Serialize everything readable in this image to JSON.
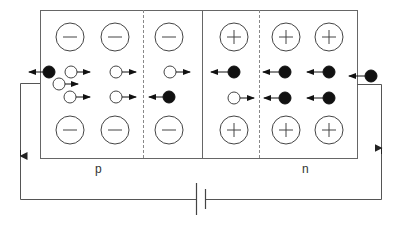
{
  "diagram": {
    "regions": [
      {
        "id": "p",
        "label": "p"
      },
      {
        "id": "n",
        "label": "n"
      }
    ],
    "colors": {
      "line": "#555555",
      "ion_stroke": "#444444",
      "electron_fill": "#111111",
      "hole_fill": "#ffffff",
      "background": "#ffffff"
    },
    "ions": {
      "negative_symbol": "−",
      "positive_symbol": "+",
      "p_side_top": [
        "−",
        "−",
        "−"
      ],
      "p_side_bottom": [
        "−",
        "−",
        "−"
      ],
      "n_side_top": [
        "+",
        "+",
        "+"
      ],
      "n_side_bottom": [
        "+",
        "+",
        "+"
      ]
    },
    "carriers": {
      "holes": "open circles moving right",
      "electrons": "filled circles moving left"
    },
    "circuit": {
      "battery": "DC cell",
      "current_direction_left": "down",
      "current_direction_right": "up"
    }
  }
}
